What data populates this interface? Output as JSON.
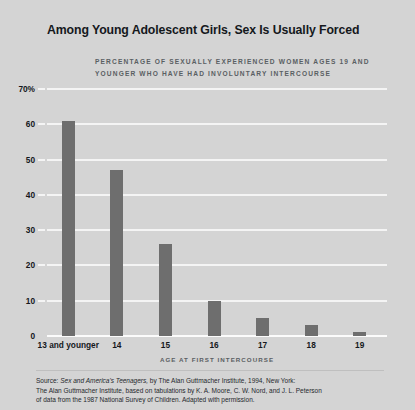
{
  "chart_data": {
    "type": "bar",
    "title": "Among Young Adolescent Girls, Sex Is Usually Forced",
    "subtitle": "PERCENTAGE OF SEXUALLY EXPERIENCED WOMEN AGES 19 AND YOUNGER WHO HAVE HAD INVOLUNTARY INTERCOURSE",
    "xlabel": "AGE AT FIRST INTERCOURSE",
    "ylabel": "",
    "categories": [
      "13 and younger",
      "14",
      "15",
      "16",
      "17",
      "18",
      "19"
    ],
    "values": [
      61,
      47,
      26,
      10,
      5,
      3,
      1
    ],
    "ylim": [
      0,
      70
    ],
    "yticks": [
      0,
      10,
      20,
      30,
      40,
      50,
      60,
      70
    ],
    "ytick_labels": [
      "0",
      "10",
      "20",
      "30",
      "40",
      "50",
      "60",
      "70%"
    ],
    "grid": true,
    "legend": "none",
    "bar_color": "#6e6e6e",
    "background_color": "#d4d4d4",
    "gridline_color": "#f4f4f4"
  },
  "source": {
    "label": "Source:",
    "italic_title": "Sex and America's Teenagers,",
    "line1_rest": " by The Alan Guttmacher Institute, 1994, New York:",
    "line2": "The Alan Guttmacher Institute, based on tabulations by K. A. Moore, C. W. Nord, and J. L. Peterson",
    "line3": "of data from the 1987 National Survey of Children. Adapted with permission."
  }
}
